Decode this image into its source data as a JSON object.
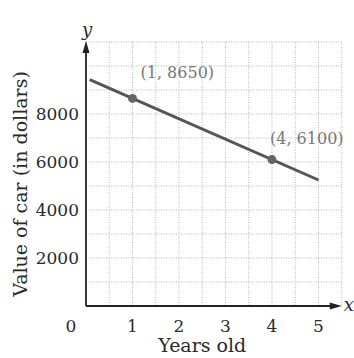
{
  "chart_data": {
    "type": "line",
    "title": "",
    "xlabel": "Years old",
    "ylabel": "Value of car (in dollars)",
    "x_axis_symbol": "x",
    "y_axis_symbol": "y",
    "xlim": [
      0,
      5.5
    ],
    "ylim": [
      0,
      11000
    ],
    "x_ticks": [
      0,
      1,
      2,
      3,
      4,
      5
    ],
    "x_tick_labels": [
      "0",
      "1",
      "2",
      "3",
      "4",
      "5"
    ],
    "y_ticks": [
      2000,
      4000,
      6000,
      8000
    ],
    "y_tick_labels": [
      "2000",
      "4000",
      "6000",
      "8000"
    ],
    "grid": true,
    "grid_x_step": 0.5,
    "grid_y_step": 1000,
    "series": [
      {
        "name": "car value",
        "x": [
          0.08,
          5
        ],
        "y": [
          9432,
          5250
        ],
        "color": "#555555"
      }
    ],
    "points": [
      {
        "x": 1,
        "y": 8650,
        "label": "(1, 8650)"
      },
      {
        "x": 4,
        "y": 6100,
        "label": "(4, 6100)"
      }
    ],
    "legend": null
  },
  "colors": {
    "line": "#555555",
    "point": "#666666",
    "axis": "#222222",
    "grid": "#b5b5b5",
    "text": "#2a2a2a",
    "annotation": "#777777"
  }
}
